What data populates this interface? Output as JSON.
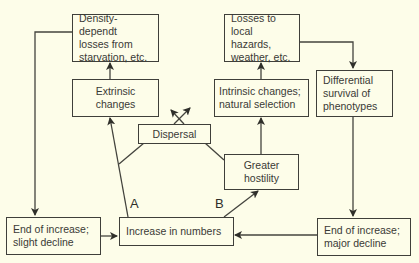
{
  "nodes": {
    "density": {
      "label": "Density-dependt\nlosses from\nstarvation, etc."
    },
    "extrinsic": {
      "label": "Extrinsic\nchanges"
    },
    "losses": {
      "label": "Losses to\nlocal hazards,\nweather, etc."
    },
    "intrinsic": {
      "label": "Intrinsic changes;\nnatural selection"
    },
    "differential": {
      "label": "Differential\nsurvival of\nphenotypes"
    },
    "dispersal": {
      "label": "Dispersal"
    },
    "hostility": {
      "label": "Greater\nhostility"
    },
    "end_slight": {
      "label": "End of increase;\nslight decline"
    },
    "increase": {
      "label": "Increase in numbers"
    },
    "end_major": {
      "label": "End of increase;\nmajor decline"
    }
  },
  "path_labels": {
    "a": "A",
    "b": "B"
  },
  "edges": [
    {
      "from": "increase",
      "to": "extrinsic",
      "label": "A"
    },
    {
      "from": "increase",
      "to": "hostility",
      "label": "B"
    },
    {
      "from": "extrinsic",
      "to": "density"
    },
    {
      "from": "hostility",
      "to": "intrinsic"
    },
    {
      "from": "intrinsic",
      "to": "losses"
    },
    {
      "from": "losses",
      "to": "differential"
    },
    {
      "from": "differential",
      "to": "end_major"
    },
    {
      "from": "density",
      "to": "end_slight"
    },
    {
      "from": "end_slight",
      "to": "increase"
    },
    {
      "from": "end_major",
      "to": "increase"
    },
    {
      "from": "dispersal",
      "to": "outward"
    }
  ]
}
